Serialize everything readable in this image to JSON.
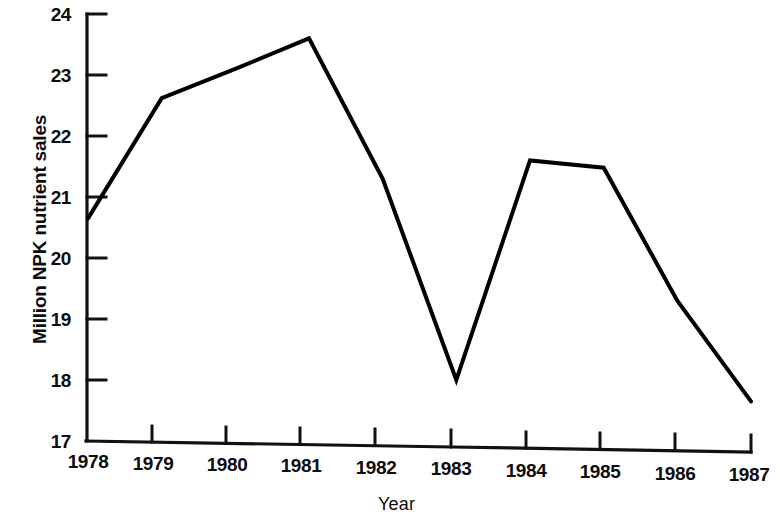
{
  "chart_data": {
    "type": "line",
    "title": "",
    "xlabel": "Year",
    "ylabel": "Million NPK nutrient sales",
    "x": [
      1978,
      1979,
      1980,
      1981,
      1982,
      1983,
      1984,
      1985,
      1986,
      1987
    ],
    "xtick_labels": [
      "1978",
      "1979",
      "1980",
      "1981",
      "1982",
      "1983",
      "1984",
      "1985",
      "1986",
      "1987"
    ],
    "ytick_labels": [
      "17",
      "18",
      "19",
      "20",
      "21",
      "22",
      "23",
      "24"
    ],
    "ytick_values": [
      17,
      18,
      19,
      20,
      21,
      22,
      23,
      24
    ],
    "values": [
      20.65,
      22.62,
      23.1,
      23.6,
      21.3,
      18.0,
      21.6,
      21.48,
      19.3,
      17.65
    ],
    "series": [
      {
        "name": "Million NPK nutrient sales",
        "values": [
          20.65,
          22.62,
          23.1,
          23.6,
          21.3,
          18.0,
          21.6,
          21.48,
          19.3,
          17.65
        ],
        "color": "#000000"
      }
    ],
    "xlim": [
      1978,
      1987
    ],
    "ylim": [
      17,
      24
    ],
    "grid": false,
    "legend": false,
    "legend_position": "none",
    "line_color": "#000000",
    "line_width": 4,
    "markers": false,
    "annotations": []
  },
  "axes": {
    "y_title": "Million NPK nutrient sales",
    "x_title": "Year",
    "y_ticks": [
      {
        "label": "24",
        "value": 24
      },
      {
        "label": "23",
        "value": 23
      },
      {
        "label": "22",
        "value": 22
      },
      {
        "label": "21",
        "value": 21
      },
      {
        "label": "20",
        "value": 20
      },
      {
        "label": "19",
        "value": 19
      },
      {
        "label": "18",
        "value": 18
      },
      {
        "label": "17",
        "value": 17
      }
    ],
    "x_ticks": [
      {
        "label": "1978"
      },
      {
        "label": "1979"
      },
      {
        "label": "1980"
      },
      {
        "label": "1981"
      },
      {
        "label": "1982"
      },
      {
        "label": "1983"
      },
      {
        "label": "1984"
      },
      {
        "label": "1985"
      },
      {
        "label": "1986"
      },
      {
        "label": "1987"
      }
    ]
  },
  "colors": {
    "background": "#ffffff",
    "ink": "#000000",
    "axis": "#111111"
  }
}
